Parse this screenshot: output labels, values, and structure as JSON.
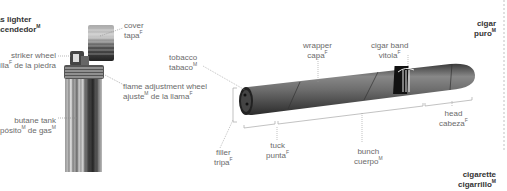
{
  "lighter": {
    "title_en": "gas lighter",
    "title_es": "encendedor",
    "title_es_gender": "M",
    "parts": [
      {
        "en": "cover",
        "es": "tapa",
        "gender": "F"
      },
      {
        "en": "striker wheel",
        "es": "ruedecilla",
        "es_suffix": " de la piedra",
        "gender": "F"
      },
      {
        "en": "flame adjustment wheel",
        "es": "ajuste",
        "es_suffix": " de la llama",
        "gender": "M",
        "gender2": "F"
      },
      {
        "en": "butane tank",
        "es": "depósito",
        "es_suffix": " de gas",
        "gender": "M",
        "gender2": "M"
      }
    ]
  },
  "cigar": {
    "title_en": "cigar",
    "title_es": "puro",
    "title_es_gender": "M",
    "parts": [
      {
        "en": "tobacco",
        "es": "tabaco",
        "gender": "M"
      },
      {
        "en": "wrapper",
        "es": "capa",
        "gender": "F"
      },
      {
        "en": "cigar band",
        "es": "vitola",
        "gender": "F"
      },
      {
        "en": "filler",
        "es": "tripa",
        "gender": "F"
      },
      {
        "en": "tuck",
        "es": "punta",
        "gender": "F"
      },
      {
        "en": "bunch",
        "es": "cuerpo",
        "gender": "M"
      },
      {
        "en": "head",
        "es": "cabeza",
        "gender": "F"
      }
    ]
  },
  "cigarette": {
    "title_en": "cigarette",
    "title_es": "cigarrillo",
    "title_es_gender": "M"
  }
}
